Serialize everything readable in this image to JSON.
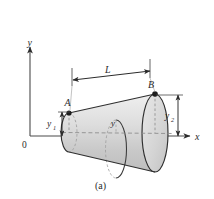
{
  "figure": {
    "caption": "(a)",
    "axes": {
      "x_label": "x",
      "y_label": "y",
      "origin_label": "0"
    },
    "points": [
      {
        "id": "A",
        "label": "A",
        "x": 69,
        "y": 113
      },
      {
        "id": "B",
        "label": "B",
        "x": 155,
        "y": 94
      }
    ],
    "dimensions": [
      {
        "id": "L",
        "label": "L",
        "sub": ""
      },
      {
        "id": "y1",
        "label": "y",
        "sub": "1"
      },
      {
        "id": "y2",
        "label": "y",
        "sub": "2"
      }
    ],
    "body_label": {
      "label": "y",
      "sub": ""
    },
    "colors": {
      "stroke": "#2b2b2b",
      "outline": "#3a3a3a",
      "fill_light": "#e3e3e3",
      "fill_mid": "#d2d2d2",
      "fill_dark": "#c0c0c0",
      "background": "#ffffff",
      "dash": "#8a8a8a"
    }
  }
}
